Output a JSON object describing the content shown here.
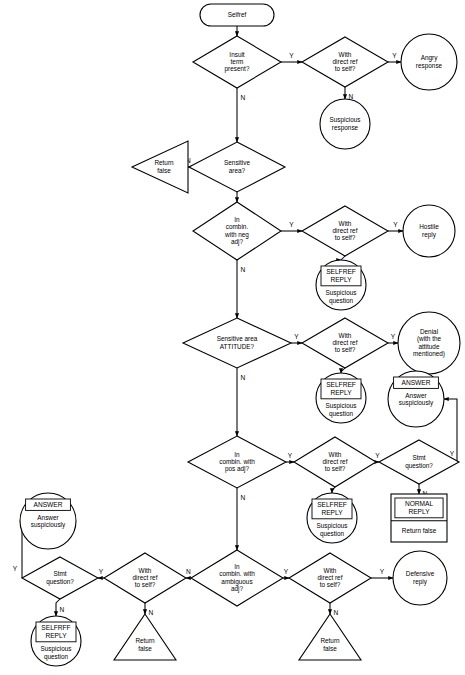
{
  "chart_data": {
    "type": "diagram",
    "title": "Selfref",
    "diagram_kind": "flowchart",
    "orientation": "top-to-bottom",
    "width": 465,
    "height": 675,
    "nodes": [
      {
        "id": "start",
        "shape": "stadium",
        "label": "Selfref",
        "x": 237,
        "y": 15,
        "w": 74,
        "h": 22
      },
      {
        "id": "d_insult",
        "shape": "diamond",
        "label": "Insult\nterm\npresent?",
        "x": 237,
        "y": 62,
        "w": 88,
        "h": 52
      },
      {
        "id": "d_ref1",
        "shape": "diamond",
        "label": "With\ndirect ref\nto self?",
        "x": 345,
        "y": 62,
        "w": 86,
        "h": 50
      },
      {
        "id": "c_angry",
        "shape": "circle",
        "label": "Angry\nresponse",
        "x": 429,
        "y": 62,
        "w": 56,
        "h": 56
      },
      {
        "id": "c_susp1",
        "shape": "circle",
        "label": "Suspicious\nresponse",
        "x": 345,
        "y": 124,
        "w": 50,
        "h": 50
      },
      {
        "id": "d_sens",
        "shape": "diamond",
        "label": "Sensitive\narea?",
        "x": 237,
        "y": 167,
        "w": 96,
        "h": 50
      },
      {
        "id": "t_rf1",
        "shape": "triangle-left",
        "label": "Return\nfalse",
        "x": 160,
        "y": 167,
        "w": 56,
        "h": 52
      },
      {
        "id": "d_neg",
        "shape": "diamond",
        "label": "In\ncombin.\nwith neg\nadj?",
        "x": 237,
        "y": 231,
        "w": 88,
        "h": 58
      },
      {
        "id": "d_ref2",
        "shape": "diamond",
        "label": "With\ndirect ref\nto self?",
        "x": 345,
        "y": 231,
        "w": 86,
        "h": 50
      },
      {
        "id": "c_hostile",
        "shape": "circle",
        "label": "Hostile\nreply",
        "x": 429,
        "y": 231,
        "w": 52,
        "h": 52
      },
      {
        "id": "c_selfref1",
        "shape": "circle-box",
        "label_box": "SELFREF\nREPLY",
        "label": "Suspicious\nquestion",
        "x": 341,
        "y": 285,
        "w": 50,
        "h": 50
      },
      {
        "id": "d_attitude",
        "shape": "diamond",
        "label": "Sensitive area\nATTITUDE?",
        "x": 237,
        "y": 343,
        "w": 108,
        "h": 50
      },
      {
        "id": "d_ref3",
        "shape": "diamond",
        "label": "With\ndirect ref\nto self?",
        "x": 345,
        "y": 343,
        "w": 86,
        "h": 50
      },
      {
        "id": "c_denial",
        "shape": "circle",
        "label": "Denial\n(with the\nattitude\nmentioned)",
        "x": 429,
        "y": 343,
        "w": 62,
        "h": 62
      },
      {
        "id": "c_selfref2",
        "shape": "circle-box",
        "label_box": "SELFREF\nREPLY",
        "label": "Suspicious\nquestion",
        "x": 341,
        "y": 398,
        "w": 50,
        "h": 50
      },
      {
        "id": "c_answer_r",
        "shape": "circle-box",
        "label_box": "ANSWER",
        "label": "Answer\nsuspiciously",
        "x": 416,
        "y": 399,
        "w": 56,
        "h": 56
      },
      {
        "id": "d_pos",
        "shape": "diamond",
        "label": "In\ncombin. with\npos adj?",
        "x": 237,
        "y": 462,
        "w": 98,
        "h": 52
      },
      {
        "id": "d_ref4",
        "shape": "diamond",
        "label": "With\ndirect ref\nto self?",
        "x": 335,
        "y": 462,
        "w": 82,
        "h": 50
      },
      {
        "id": "d_stmt_r",
        "shape": "diamond",
        "label": "Stmt\nquestion?",
        "x": 419,
        "y": 462,
        "w": 80,
        "h": 44
      },
      {
        "id": "c_selfref3",
        "shape": "circle-box",
        "label_box": "SELFREF\nREPLY",
        "label": "Suspicious\nquestion",
        "x": 332,
        "y": 518,
        "w": 50,
        "h": 50
      },
      {
        "id": "r_normal",
        "shape": "rect",
        "label_box": "NORMAL\nREPLY",
        "label": "Return false",
        "x": 419,
        "y": 518,
        "w": 56,
        "h": 48
      },
      {
        "id": "c_answer_l",
        "shape": "circle-box",
        "label_box": "ANSWER",
        "label": "Answer\nsuspiciously",
        "x": 48,
        "y": 521,
        "w": 56,
        "h": 56
      },
      {
        "id": "d_ambig",
        "shape": "diamond",
        "label": "In\ncombin. with\nambiguous\nadj?",
        "x": 237,
        "y": 578,
        "w": 92,
        "h": 56
      },
      {
        "id": "d_ref5",
        "shape": "diamond",
        "label": "With\ndirect ref\nto self?",
        "x": 145,
        "y": 578,
        "w": 82,
        "h": 50
      },
      {
        "id": "d_stmt_l",
        "shape": "diamond",
        "label": "Stmt\nquestion?",
        "x": 60,
        "y": 578,
        "w": 76,
        "h": 42
      },
      {
        "id": "d_ref6",
        "shape": "diamond",
        "label": "With\ndirect ref\nto self?",
        "x": 330,
        "y": 578,
        "w": 82,
        "h": 50
      },
      {
        "id": "c_defensive",
        "shape": "circle",
        "label": "Defensive\nreply",
        "x": 420,
        "y": 578,
        "w": 54,
        "h": 54
      },
      {
        "id": "t_rf2",
        "shape": "triangle-up",
        "label": "Return\nfalse",
        "x": 145,
        "y": 637,
        "w": 62,
        "h": 46
      },
      {
        "id": "t_rf3",
        "shape": "triangle-up",
        "label": "Return\nfalse",
        "x": 330,
        "y": 637,
        "w": 62,
        "h": 46
      },
      {
        "id": "c_selfref4",
        "shape": "circle-box",
        "label_box": "SELFRFF\nREPLY",
        "label": "Suspicious\nquestion",
        "x": 56,
        "y": 641,
        "w": 50,
        "h": 50
      }
    ],
    "edges": [
      {
        "from": "start",
        "to": "d_insult",
        "label": ""
      },
      {
        "from": "d_insult",
        "to": "d_ref1",
        "label": "Y"
      },
      {
        "from": "d_insult",
        "to": "d_sens",
        "label": "N"
      },
      {
        "from": "d_ref1",
        "to": "c_angry",
        "label": "Y"
      },
      {
        "from": "d_ref1",
        "to": "c_susp1",
        "label": "N"
      },
      {
        "from": "d_sens",
        "to": "t_rf1",
        "label": "N"
      },
      {
        "from": "d_sens",
        "to": "d_neg",
        "label": ""
      },
      {
        "from": "d_neg",
        "to": "d_ref2",
        "label": "Y"
      },
      {
        "from": "d_neg",
        "to": "d_attitude",
        "label": "N"
      },
      {
        "from": "d_ref2",
        "to": "c_hostile",
        "label": "Y"
      },
      {
        "from": "d_ref2",
        "to": "c_selfref1",
        "label": ""
      },
      {
        "from": "d_attitude",
        "to": "d_ref3",
        "label": "Y"
      },
      {
        "from": "d_attitude",
        "to": "d_pos",
        "label": "N"
      },
      {
        "from": "d_ref3",
        "to": "c_denial",
        "label": "Y"
      },
      {
        "from": "d_ref3",
        "to": "c_selfref2",
        "label": "N"
      },
      {
        "from": "d_pos",
        "to": "d_ref4",
        "label": "Y"
      },
      {
        "from": "d_pos",
        "to": "d_ambig",
        "label": "N"
      },
      {
        "from": "d_ref4",
        "to": "d_stmt_r",
        "label": "Y"
      },
      {
        "from": "d_ref4",
        "to": "c_selfref3",
        "label": "N"
      },
      {
        "from": "d_stmt_r",
        "to": "c_answer_r",
        "label": "Y"
      },
      {
        "from": "d_stmt_r",
        "to": "r_normal",
        "label": "N"
      },
      {
        "from": "d_ambig",
        "to": "d_ref5",
        "label": "N"
      },
      {
        "from": "d_ambig",
        "to": "d_ref6",
        "label": "Y"
      },
      {
        "from": "d_ref5",
        "to": "d_stmt_l",
        "label": "Y"
      },
      {
        "from": "d_ref5",
        "to": "t_rf2",
        "label": "N"
      },
      {
        "from": "d_stmt_l",
        "to": "c_answer_l",
        "label": "Y"
      },
      {
        "from": "d_stmt_l",
        "to": "c_selfref4",
        "label": "N"
      },
      {
        "from": "d_ref6",
        "to": "c_defensive",
        "label": "Y"
      },
      {
        "from": "d_ref6",
        "to": "t_rf3",
        "label": "N"
      }
    ],
    "edge_labels": [
      "Y",
      "N"
    ],
    "colors": {
      "stroke": "#000000",
      "fill": "#ffffff",
      "text": "#000000"
    }
  }
}
